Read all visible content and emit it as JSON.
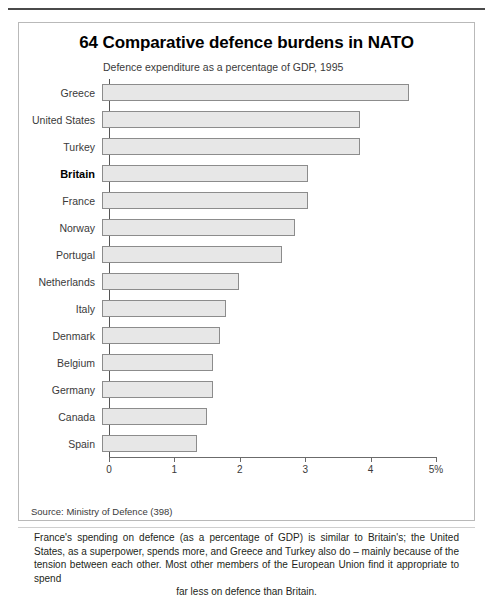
{
  "chart_data": {
    "type": "bar",
    "orientation": "horizontal",
    "title": "64 Comparative defence burdens in NATO",
    "subtitle": "Defence expenditure as a percentage of GDP, 1995",
    "xlabel": "",
    "ylabel": "",
    "xlim": [
      0,
      5
    ],
    "grid": false,
    "legend": null,
    "tick_labels": [
      "0",
      "1",
      "2",
      "3",
      "4",
      "5%"
    ],
    "tick_values": [
      0,
      1,
      2,
      3,
      4,
      5
    ],
    "categories": [
      "Greece",
      "United States",
      "Turkey",
      "Britain",
      "France",
      "Norway",
      "Portugal",
      "Netherlands",
      "Italy",
      "Denmark",
      "Belgium",
      "Germany",
      "Canada",
      "Spain"
    ],
    "values": [
      4.7,
      3.95,
      3.95,
      3.15,
      3.15,
      2.95,
      2.75,
      2.1,
      1.9,
      1.8,
      1.7,
      1.7,
      1.6,
      1.45
    ],
    "highlight_category": "Britain",
    "bar_fill": "#e7e7e7",
    "bar_stroke": "#8c8c8c",
    "source": "Source: Ministry of Defence (398)"
  },
  "caption": {
    "body": "France's spending on defence (as a percentage of GDP) is similar to Britain's; the United States, as a superpower, spends more, and Greece and Turkey also do – mainly because of the tension between each other. Most other members of the European Union find it appropriate to spend",
    "last_line": "far less on defence than Britain."
  }
}
